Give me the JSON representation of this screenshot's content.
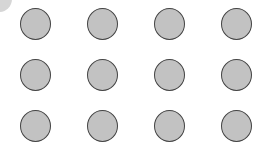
{
  "canvas": {
    "background": "#ffffff",
    "corner_shape_color": "#d6d6d6"
  },
  "grid": {
    "rows": 3,
    "cols": 4,
    "fill_color": "#c2c2c2",
    "stroke_color": "#444444",
    "column_centers_x": [
      36,
      103,
      170,
      237
    ],
    "row_centers_y": [
      24,
      75,
      126
    ],
    "diameter": 32,
    "items": [
      {
        "row": 0,
        "col": 0
      },
      {
        "row": 0,
        "col": 1
      },
      {
        "row": 0,
        "col": 2
      },
      {
        "row": 0,
        "col": 3
      },
      {
        "row": 1,
        "col": 0
      },
      {
        "row": 1,
        "col": 1
      },
      {
        "row": 1,
        "col": 2
      },
      {
        "row": 1,
        "col": 3
      },
      {
        "row": 2,
        "col": 0
      },
      {
        "row": 2,
        "col": 1
      },
      {
        "row": 2,
        "col": 2
      },
      {
        "row": 2,
        "col": 3
      }
    ]
  }
}
